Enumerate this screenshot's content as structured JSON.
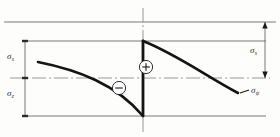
{
  "figure": {
    "type": "stress-distribution-diagram",
    "title": "",
    "background_color": "#fdfdfc",
    "line_color": "#555555",
    "curve_color": "#1a1a1a",
    "label_color": "#2a2a2a"
  },
  "labels": {
    "sigma_top_left": {
      "symbol": "σ",
      "subscript": "s"
    },
    "sigma_bottom_left": {
      "symbol": "σ",
      "subscript": "z"
    },
    "sigma_right": {
      "symbol": "σ",
      "subscript": "s"
    },
    "sigma_curve": {
      "symbol": "σ",
      "subscript": "ψ"
    }
  },
  "signs": {
    "positive": "+",
    "negative": "−"
  },
  "geometry": {
    "axis_x": 143,
    "line_top_y": 22,
    "line_upper_y": 41,
    "centerline_y": 78,
    "line_bottom_y": 116,
    "dim_left_x": 25,
    "dim_right_x": 265,
    "left_curve": {
      "x0": 38,
      "y0": 62,
      "x1": 143,
      "y1": 116
    },
    "right_curve": {
      "x0": 143,
      "y0": 41,
      "x1": 238,
      "y1": 93
    },
    "jump": {
      "x": 143,
      "y_bottom": 116,
      "y_top": 41
    },
    "plus_marker": {
      "cx": 146,
      "cy": 67,
      "r": 7
    },
    "minus_marker": {
      "cx": 119,
      "cy": 88,
      "r": 7
    }
  }
}
